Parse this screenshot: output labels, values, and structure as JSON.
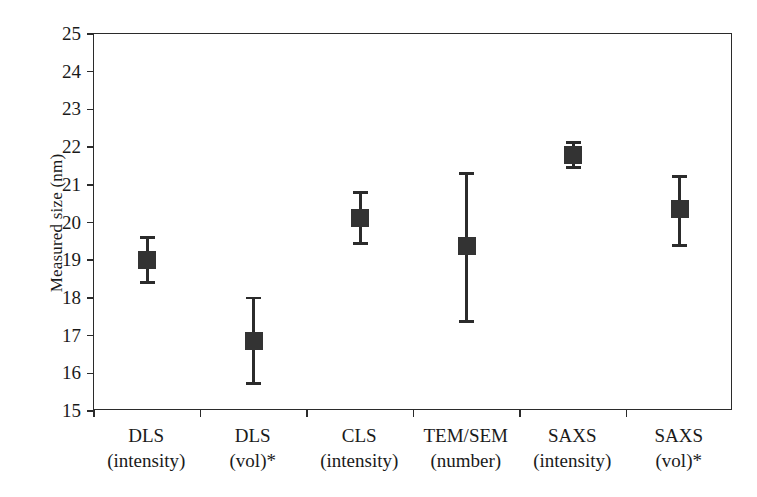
{
  "chart_data": {
    "type": "scatter",
    "title": "",
    "xlabel": "",
    "ylabel": "Measured size (nm)",
    "ylim": [
      15,
      25
    ],
    "ytick_values": [
      25,
      24,
      23,
      22,
      21,
      20,
      19,
      18,
      17,
      16,
      15
    ],
    "ytick_labels": [
      "25",
      "24",
      "23",
      "22",
      "21",
      "20",
      "19",
      "18",
      "17",
      "16",
      "15"
    ],
    "grid": false,
    "legend": "none",
    "marker_color": "#333333",
    "axis_color": "#2b2b2b",
    "categories": [
      "DLS (intensity)",
      "DLS (vol)*",
      "CLS (intensity)",
      "TEM/SEM (number)",
      "SAXS (intensity)",
      "SAXS (vol)*"
    ],
    "category_lines": [
      {
        "line1": "DLS",
        "line2": "(intensity)"
      },
      {
        "line1": "DLS",
        "line2": "(vol)*"
      },
      {
        "line1": "CLS",
        "line2": "(intensity)"
      },
      {
        "line1": "TEM/SEM",
        "line2": "(number)"
      },
      {
        "line1": "SAXS",
        "line2": "(intensity)"
      },
      {
        "line1": "SAXS",
        "line2": "(vol)*"
      }
    ],
    "values": [
      19.0,
      16.87,
      20.13,
      19.37,
      21.78,
      20.35
    ],
    "err_low": [
      18.4,
      15.73,
      19.45,
      17.38,
      21.45,
      19.38
    ],
    "err_high": [
      19.6,
      18.0,
      20.8,
      21.3,
      22.13,
      21.22
    ],
    "points": [
      {
        "category": "DLS (intensity)",
        "value": 19.0,
        "low": 18.4,
        "high": 19.6
      },
      {
        "category": "DLS (vol)*",
        "value": 16.87,
        "low": 15.73,
        "high": 18.0
      },
      {
        "category": "CLS (intensity)",
        "value": 20.13,
        "low": 19.45,
        "high": 20.8
      },
      {
        "category": "TEM/SEM (number)",
        "value": 19.37,
        "low": 17.38,
        "high": 21.3
      },
      {
        "category": "SAXS (intensity)",
        "value": 21.78,
        "low": 21.45,
        "high": 22.13
      },
      {
        "category": "SAXS (vol)*",
        "value": 20.35,
        "low": 19.38,
        "high": 21.22
      }
    ]
  }
}
